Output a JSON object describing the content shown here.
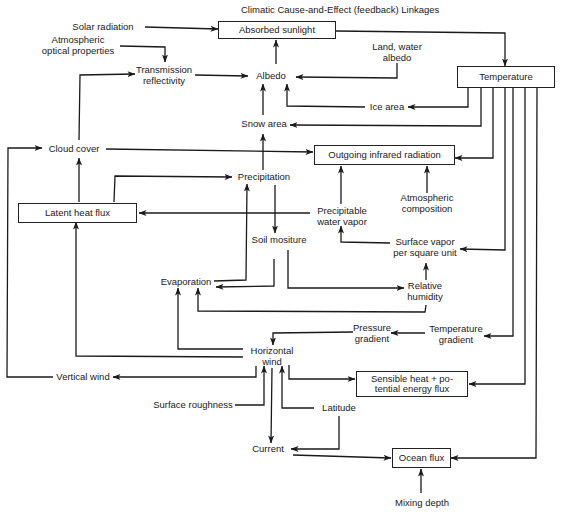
{
  "title": "Climatic Cause-and-Effect (feedback) Linkages",
  "nodes": {
    "solar_radiation": "Solar radiation",
    "absorbed_sunlight": "Absorbed sunlight",
    "atm_optical_1": "Atmospheric",
    "atm_optical_2": "optical properties",
    "transmission_1": "Transmission",
    "transmission_2": "reflectivity",
    "albedo": "Albedo",
    "land_water_1": "Land, water",
    "land_water_2": "albedo",
    "temperature": "Temperature",
    "ice_area": "Ice area",
    "snow_area": "Snow area",
    "cloud_cover": "Cloud cover",
    "outgoing_ir": "Outgoing infrared radiation",
    "precipitation": "Precipitation",
    "atm_comp_1": "Atmospheric",
    "atm_comp_2": "composition",
    "latent_heat_flux": "Latent heat flux",
    "precip_vapor_1": "Precipitable",
    "precip_vapor_2": "water vapor",
    "soil_moisture": "Soil mositure",
    "surface_vapor_1": "Surface vapor",
    "surface_vapor_2": "per square unit",
    "evaporation": "Evaporation",
    "relative_humidity_1": "Relative",
    "relative_humidity_2": "humidity",
    "pressure_gradient_1": "Pressure",
    "pressure_gradient_2": "gradient",
    "temperature_gradient_1": "Temperature",
    "temperature_gradient_2": "gradient",
    "horizontal_wind_1": "Horizontal",
    "horizontal_wind_2": "wind",
    "vertical_wind": "Vertical wind",
    "sensible_heat_1": "Sensible heat + po-",
    "sensible_heat_2": "tential energy flux",
    "surface_roughness": "Surface roughness",
    "latitude": "Latitude",
    "current": "Current",
    "ocean_flux": "Ocean flux",
    "mixing_depth": "Mixing depth"
  },
  "colors": {
    "line": "#1a1a1a",
    "background": "#ffffff"
  }
}
